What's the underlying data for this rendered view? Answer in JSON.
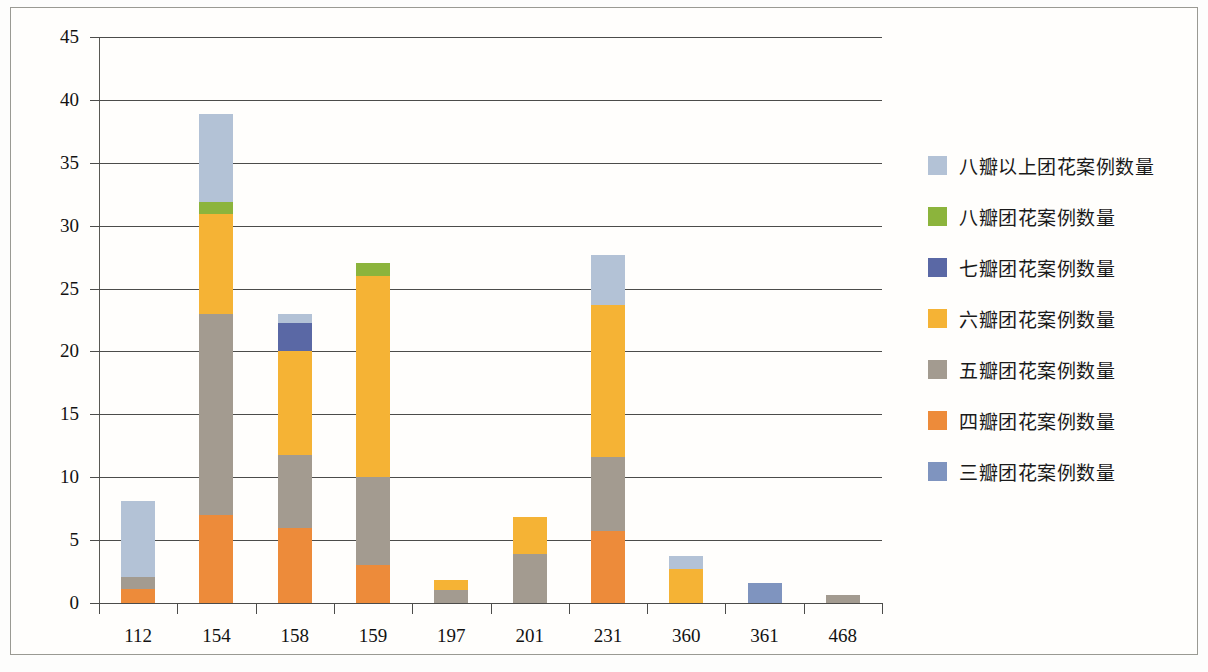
{
  "chart_data": {
    "type": "bar",
    "stacked": true,
    "title": "",
    "xlabel": "",
    "ylabel": "",
    "ylim": [
      0,
      45
    ],
    "ytick_step": 5,
    "yticks": [
      "0",
      "5",
      "10",
      "15",
      "20",
      "25",
      "30",
      "35",
      "40",
      "45"
    ],
    "grid": true,
    "legend_position": "right",
    "categories": [
      "112",
      "154",
      "158",
      "159",
      "197",
      "201",
      "231",
      "360",
      "361",
      "468"
    ],
    "series": [
      {
        "name": "三瓣团花案例数量",
        "color": "#7f94bf",
        "values": [
          0,
          0,
          0,
          0,
          0,
          0,
          0,
          0,
          1.6,
          0
        ]
      },
      {
        "name": "四瓣团花案例数量",
        "color": "#ed8b3a",
        "values": [
          1.1,
          7,
          6,
          3,
          0,
          0,
          5.7,
          0,
          0,
          0
        ]
      },
      {
        "name": "五瓣团花案例数量",
        "color": "#a39b90",
        "values": [
          1.0,
          16,
          5.8,
          7,
          1.0,
          3.9,
          5.9,
          0,
          0,
          0.6
        ]
      },
      {
        "name": "六瓣团花案例数量",
        "color": "#f5b335",
        "values": [
          0,
          7.9,
          8.2,
          16,
          0.8,
          2.9,
          12.1,
          2.7,
          0,
          0
        ]
      },
      {
        "name": "七瓣团花案例数量",
        "color": "#5a68a5",
        "values": [
          0,
          0,
          2.3,
          0,
          0,
          0,
          0,
          0,
          0,
          0
        ]
      },
      {
        "name": "八瓣团花案例数量",
        "color": "#8cb43c",
        "values": [
          0,
          1.0,
          0,
          1.0,
          0,
          0,
          0,
          0,
          0,
          0
        ]
      },
      {
        "name": "八瓣以上团花案例数量",
        "color": "#b3c2d6",
        "values": [
          6.0,
          7.0,
          0.7,
          0,
          0,
          0,
          4.0,
          1.0,
          0,
          0
        ]
      }
    ],
    "totals": [
      8.1,
      38.9,
      23.0,
      27.0,
      1.8,
      6.8,
      27.7,
      3.7,
      1.6,
      0.6
    ]
  },
  "legend": {
    "entries": [
      {
        "label": "八瓣以上团花案例数量",
        "color": "#b3c2d6"
      },
      {
        "label": "八瓣团花案例数量",
        "color": "#8cb43c"
      },
      {
        "label": "七瓣团花案例数量",
        "color": "#5a68a5"
      },
      {
        "label": "六瓣团花案例数量",
        "color": "#f5b335"
      },
      {
        "label": "五瓣团花案例数量",
        "color": "#a39b90"
      },
      {
        "label": "四瓣团花案例数量",
        "color": "#ed8b3a"
      },
      {
        "label": "三瓣团花案例数量",
        "color": "#7f94bf"
      }
    ]
  }
}
